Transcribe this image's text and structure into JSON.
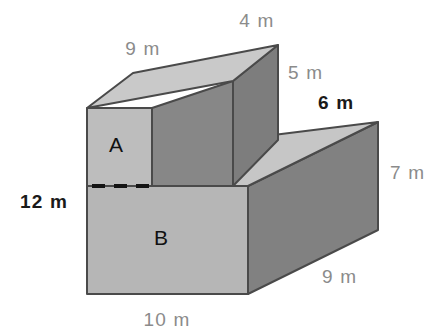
{
  "figure": {
    "background_color": "#ffffff",
    "face_labels": [
      {
        "id": "A",
        "text": "A",
        "x": 116,
        "y": 152
      },
      {
        "id": "B",
        "text": "B",
        "x": 161,
        "y": 245
      }
    ],
    "dimension_labels": [
      {
        "id": "top-back-left",
        "text": "9 m",
        "x": 143,
        "y": 55,
        "tone": "gray",
        "anchor": "middle"
      },
      {
        "id": "top-back-right",
        "text": "4 m",
        "x": 257,
        "y": 27,
        "tone": "gray",
        "anchor": "middle"
      },
      {
        "id": "upper-right-height",
        "text": "5 m",
        "x": 288,
        "y": 79,
        "tone": "gray",
        "anchor": "start"
      },
      {
        "id": "step-depth",
        "text": "6 m",
        "x": 318,
        "y": 109,
        "tone": "dark",
        "anchor": "start"
      },
      {
        "id": "lower-right-height",
        "text": "7 m",
        "x": 390,
        "y": 179,
        "tone": "gray",
        "anchor": "start"
      },
      {
        "id": "lower-right-depth",
        "text": "9 m",
        "x": 322,
        "y": 283,
        "tone": "gray",
        "anchor": "start"
      },
      {
        "id": "total-height",
        "text": "12 m",
        "x": 20,
        "y": 208,
        "tone": "dark",
        "anchor": "start"
      },
      {
        "id": "front-width",
        "text": "10 m",
        "x": 167,
        "y": 326,
        "tone": "gray",
        "anchor": "middle"
      }
    ],
    "colors": {
      "front_light": "#b6b6b6",
      "top_light": "#c9c9c9",
      "side_dark": "#818181",
      "step_surface": "#c6c6c6",
      "outline": "#4a4a4a",
      "dashed": "#141414",
      "label_gray": "#8b8b8b",
      "label_dark": "#1a1a1a"
    },
    "geometry": {
      "upper_top_face": "87,108 133,73 278,45 233,81",
      "upper_front_face_A": "87,108 152,108 152,186 87,186",
      "upper_side_dark": "152,108 233,81 233,186 152,186",
      "upper_right_dark": "233,81 278,45 278,140 233,186",
      "step_surface": "152,186 233,140 378,122 248,186",
      "lower_front_face_B": "87,186 248,186 248,294 87,294",
      "lower_right_dark": "248,186 378,122 378,230 248,294",
      "dashed_line": "92,186 152,186"
    },
    "measurements": [
      {
        "edge": "upper block back-top length",
        "value": "9 m"
      },
      {
        "edge": "upper block top width",
        "value": "4 m"
      },
      {
        "edge": "upper block right height",
        "value": "5 m"
      },
      {
        "edge": "step surface depth",
        "value": "6 m"
      },
      {
        "edge": "lower block right height",
        "value": "7 m"
      },
      {
        "edge": "lower block right depth",
        "value": "9 m"
      },
      {
        "edge": "total front height",
        "value": "12 m"
      },
      {
        "edge": "front base width",
        "value": "10 m"
      }
    ]
  }
}
